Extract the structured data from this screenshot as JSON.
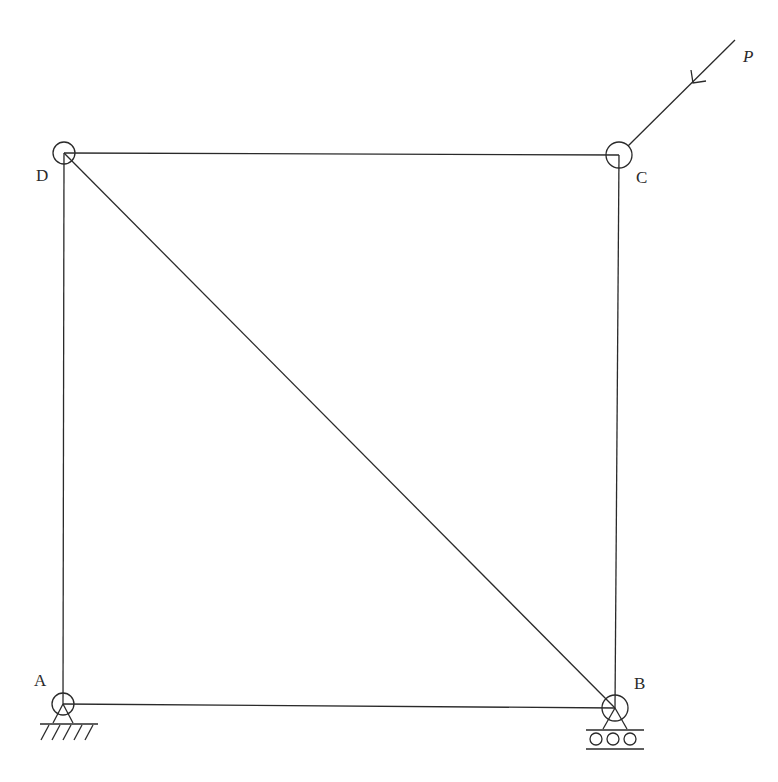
{
  "diagram": {
    "type": "truss",
    "nodes": [
      {
        "id": "A",
        "label": "A",
        "x": 63,
        "y": 704,
        "support": "pin"
      },
      {
        "id": "B",
        "label": "B",
        "x": 615,
        "y": 708,
        "support": "roller"
      },
      {
        "id": "C",
        "label": "C",
        "x": 619,
        "y": 155,
        "support": "none"
      },
      {
        "id": "D",
        "label": "D",
        "x": 64,
        "y": 153,
        "support": "none"
      }
    ],
    "members": [
      {
        "from": "A",
        "to": "B"
      },
      {
        "from": "B",
        "to": "C"
      },
      {
        "from": "C",
        "to": "D"
      },
      {
        "from": "D",
        "to": "A"
      },
      {
        "from": "D",
        "to": "B"
      }
    ],
    "loads": [
      {
        "label": "P",
        "at": "C",
        "direction": "down-left, 45 degrees toward joint C"
      }
    ],
    "colors": {
      "line": "#2a2a2a",
      "background": "#ffffff"
    }
  }
}
